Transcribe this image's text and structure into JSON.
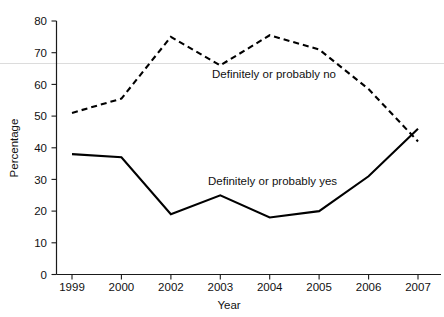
{
  "chart_data": {
    "type": "line",
    "title": "",
    "xlabel": "Year",
    "ylabel": "Percentage",
    "categories": [
      "1999",
      "2000",
      "2002",
      "2003",
      "2004",
      "2005",
      "2006",
      "2007"
    ],
    "x": [
      1999,
      2000,
      2002,
      2003,
      2004,
      2005,
      2006,
      2007
    ],
    "ylim": [
      0,
      80
    ],
    "yticks": [
      0,
      10,
      20,
      30,
      40,
      50,
      60,
      70,
      80
    ],
    "ytick_labels": [
      "0",
      "10",
      "20",
      "30",
      "40",
      "50",
      "60",
      "70",
      "80"
    ],
    "grid": false,
    "legend": "inline-annotations",
    "series": [
      {
        "name": "Definitely or probably no",
        "style": "dashed",
        "color": "#000000",
        "values": [
          51,
          55.5,
          75,
          66,
          75.5,
          71,
          58.5,
          42
        ]
      },
      {
        "name": "Definitely or probably yes",
        "style": "solid",
        "color": "#000000",
        "values": [
          38,
          37,
          19,
          25,
          18,
          20,
          31,
          46
        ]
      }
    ],
    "annotations": [
      {
        "text": "Definitely or probably no",
        "x": 2003,
        "y": 62
      },
      {
        "text": "Definitely or probably yes",
        "x": 2003.6,
        "y": 31
      }
    ]
  },
  "axes": {
    "x_tick_labels": [
      "1999",
      "2000",
      "2002",
      "2003",
      "2004",
      "2005",
      "2006",
      "2007"
    ],
    "y_tick_labels": [
      "80",
      "70",
      "60",
      "50",
      "40",
      "30",
      "20",
      "10",
      "0"
    ],
    "x_title": "Year",
    "y_title": "Percentage"
  },
  "labels": {
    "series_no": "Definitely or probably no",
    "series_yes": "Definitely or probably yes"
  }
}
